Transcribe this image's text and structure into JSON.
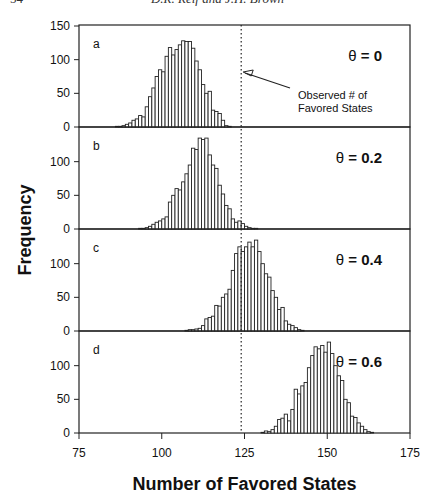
{
  "header": {
    "page_number": "54",
    "running_title": "D.R. Reif and J.H. Brown"
  },
  "chart_data": {
    "type": "bar",
    "subtype": "stacked-panel-histograms",
    "xlabel": "Number of Favored States",
    "ylabel": "Frequency",
    "xlim": [
      75,
      175
    ],
    "xticks": [
      75,
      100,
      125,
      150,
      175
    ],
    "ylim": [
      0,
      150
    ],
    "yticks": [
      0,
      50,
      100,
      150
    ],
    "grid": false,
    "reference_line": {
      "x": 124,
      "style": "dotted",
      "label": "Observed # of Favored States"
    },
    "panels": [
      {
        "id": "a",
        "theta_label": "θ = 0",
        "theta_value": "0",
        "x_start": 86,
        "values": [
          1,
          1,
          2,
          4,
          6,
          10,
          12,
          17,
          15,
          30,
          45,
          58,
          75,
          85,
          82,
          105,
          118,
          107,
          115,
          122,
          128,
          127,
          127,
          117,
          98,
          85,
          63,
          50,
          53,
          25,
          23,
          20,
          10,
          2,
          1
        ]
      },
      {
        "id": "b",
        "theta_label": "θ = 0.2",
        "theta_value": "0.2",
        "x_start": 93,
        "values": [
          1,
          1,
          2,
          4,
          7,
          10,
          12,
          15,
          18,
          40,
          50,
          60,
          58,
          70,
          82,
          95,
          120,
          118,
          135,
          133,
          135,
          110,
          95,
          90,
          65,
          52,
          35,
          30,
          15,
          10,
          12,
          8,
          4,
          2,
          1,
          1
        ]
      },
      {
        "id": "c",
        "theta_label": "θ = 0.4",
        "theta_value": "0.4",
        "x_start": 107,
        "values": [
          1,
          2,
          2,
          3,
          4,
          8,
          18,
          20,
          22,
          38,
          37,
          50,
          55,
          62,
          90,
          115,
          125,
          118,
          125,
          132,
          125,
          135,
          118,
          100,
          85,
          80,
          60,
          50,
          32,
          35,
          15,
          10,
          8,
          5,
          2,
          1
        ]
      },
      {
        "id": "d",
        "theta_label": "θ = 0.6",
        "theta_value": "0.6",
        "x_start": 130,
        "values": [
          1,
          3,
          2,
          5,
          10,
          20,
          22,
          28,
          18,
          35,
          65,
          58,
          70,
          75,
          97,
          115,
          128,
          125,
          130,
          120,
          135,
          118,
          100,
          85,
          78,
          50,
          45,
          25,
          23,
          15,
          10,
          5,
          2,
          1
        ]
      }
    ]
  },
  "labels": {
    "panel_a": "a",
    "panel_b": "b",
    "panel_c": "c",
    "panel_d": "d",
    "theta_a_sym": "θ",
    "theta_a_val": "= 0",
    "theta_b_sym": "θ",
    "theta_b_val": "= 0.2",
    "theta_c_sym": "θ",
    "theta_c_val": "= 0.4",
    "theta_d_sym": "θ",
    "theta_d_val": "= 0.6",
    "annotation_line1": "Observed # of",
    "annotation_line2": "Favored States",
    "xlabel": "Number of Favored States",
    "ylabel": "Frequency",
    "xticks": [
      "75",
      "100",
      "125",
      "150",
      "175"
    ],
    "yticks": [
      "0",
      "50",
      "100",
      "150"
    ]
  }
}
